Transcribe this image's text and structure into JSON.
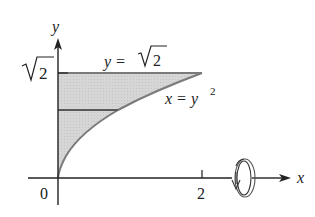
{
  "figure": {
    "axes": {
      "x_label": "x",
      "y_label": "y",
      "origin_label": "0",
      "x_tick_label": "2",
      "y_tick_label_radicand": "2"
    },
    "curves": {
      "line_label_lhs": "y = ",
      "line_label_radicand": "2",
      "parabola_label_lhs": "x = y",
      "parabola_label_exp": "2"
    },
    "colors": {
      "fill": "#d4d4d4",
      "boundary": "#7a7a7a",
      "axis": "#222222"
    },
    "rotation_axis": "x-axis",
    "rotation_icon": "rotation-arrow-icon"
  }
}
